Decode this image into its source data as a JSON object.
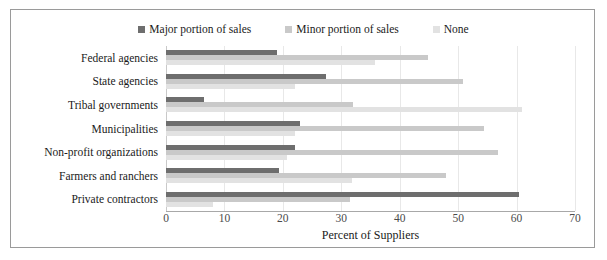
{
  "chart_data": {
    "type": "bar",
    "orientation": "horizontal",
    "title": "",
    "xlabel": "Percent of Suppliers",
    "ylabel": "",
    "xlim": [
      0,
      70
    ],
    "xticks": [
      0,
      10,
      20,
      30,
      40,
      50,
      60,
      70
    ],
    "grid": true,
    "legend_position": "top-center",
    "categories": [
      "Federal agencies",
      "State agencies",
      "Tribal governments",
      "Municipalities",
      "Non-profit organizations",
      "Farmers and ranchers",
      "Private contractors"
    ],
    "series": [
      {
        "name": "Major portion of sales",
        "color": "#6e6e6e",
        "values": [
          19.0,
          27.3,
          6.5,
          23.0,
          22.0,
          19.4,
          60.5
        ]
      },
      {
        "name": "Minor portion of sales",
        "color": "#c9c9c9",
        "values": [
          44.8,
          50.9,
          32.0,
          54.5,
          56.8,
          47.9,
          31.5
        ]
      },
      {
        "name": "None",
        "color": "#e2e2e2",
        "values": [
          35.7,
          22.1,
          61.0,
          22.0,
          20.7,
          31.8,
          8.0
        ]
      }
    ]
  },
  "legend": {
    "entries": [
      {
        "label": "Major portion of sales",
        "color": "#6e6e6e"
      },
      {
        "label": "Minor portion of sales",
        "color": "#c9c9c9"
      },
      {
        "label": "None",
        "color": "#e2e2e2"
      }
    ]
  },
  "axis": {
    "x_title": "Percent of Suppliers",
    "x_tick_labels": [
      "0",
      "10",
      "20",
      "30",
      "40",
      "50",
      "60",
      "70"
    ]
  },
  "colors": {
    "major": "#6e6e6e",
    "minor": "#c9c9c9",
    "none": "#e2e2e2",
    "frame": "#9a9a9a",
    "gridline": "#e8e8e8",
    "text": "#1a1a1a"
  }
}
